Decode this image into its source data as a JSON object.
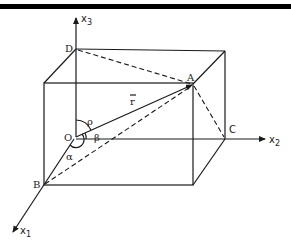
{
  "figure": {
    "type": "3D coordinate box diagram with position vector",
    "axes": {
      "x1": {
        "label": "x",
        "subscript": "1"
      },
      "x2": {
        "label": "x",
        "subscript": "2"
      },
      "x3": {
        "label": "x",
        "subscript": "3"
      }
    },
    "points": {
      "origin": "O",
      "A": "A",
      "B": "B",
      "C": "C",
      "D": "D"
    },
    "vector": {
      "label": "r",
      "overbar": true
    },
    "angles": {
      "alpha": "α",
      "beta": "β",
      "rho": "ρ"
    },
    "colors": {
      "line": "#1a1a1a",
      "background": "#ffffff",
      "top_bar": "#000000"
    }
  }
}
